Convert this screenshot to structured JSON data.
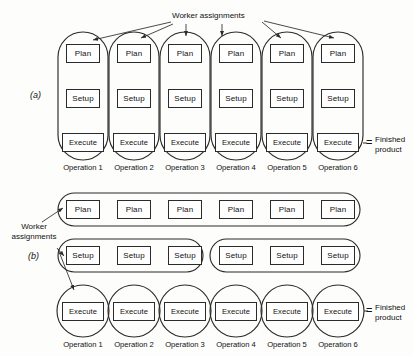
{
  "figure": {
    "background_color": "#fdfdfc",
    "line_color": "#2b2b2b",
    "text_color": "#111111"
  },
  "labels": {
    "worker_assignments_top": "Worker assignments",
    "worker_assignments_left_line1": "Worker",
    "worker_assignments_left_line2": "assignments",
    "part_a": "(a)",
    "part_b": "(b)",
    "finished_line1": "Finished",
    "finished_line2": "product",
    "equals": "="
  },
  "stages": {
    "plan": "Plan",
    "setup": "Setup",
    "execute": "Execute"
  },
  "operations": [
    "Operation 1",
    "Operation 2",
    "Operation 3",
    "Operation 4",
    "Operation 5",
    "Operation 6"
  ],
  "panel_a": {
    "part_letter": "(a)",
    "description": "Each worker performs plan, setup and execute for one operation",
    "grouping": "vertical",
    "worker_count": 6,
    "columns": [
      {
        "operation": "Operation 1",
        "cells": [
          "Plan",
          "Setup",
          "Execute"
        ]
      },
      {
        "operation": "Operation 2",
        "cells": [
          "Plan",
          "Setup",
          "Execute"
        ]
      },
      {
        "operation": "Operation 3",
        "cells": [
          "Plan",
          "Setup",
          "Execute"
        ]
      },
      {
        "operation": "Operation 4",
        "cells": [
          "Plan",
          "Setup",
          "Execute"
        ]
      },
      {
        "operation": "Operation 5",
        "cells": [
          "Plan",
          "Setup",
          "Execute"
        ]
      },
      {
        "operation": "Operation 6",
        "cells": [
          "Plan",
          "Setup",
          "Execute"
        ]
      }
    ],
    "output_label": "Finished product"
  },
  "panel_b": {
    "part_letter": "(b)",
    "description": "Specialized workers: one plans all, two set up, six execute",
    "grouping": "horizontal",
    "rows": [
      {
        "stage": "Plan",
        "groups": [
          {
            "operations": [
              "Operation 1",
              "Operation 2",
              "Operation 3",
              "Operation 4",
              "Operation 5",
              "Operation 6"
            ]
          }
        ]
      },
      {
        "stage": "Setup",
        "groups": [
          {
            "operations": [
              "Operation 1",
              "Operation 2",
              "Operation 3"
            ]
          },
          {
            "operations": [
              "Operation 4",
              "Operation 5",
              "Operation 6"
            ]
          }
        ]
      },
      {
        "stage": "Execute",
        "groups": [
          {
            "operations": [
              "Operation 1"
            ]
          },
          {
            "operations": [
              "Operation 2"
            ]
          },
          {
            "operations": [
              "Operation 3"
            ]
          },
          {
            "operations": [
              "Operation 4"
            ]
          },
          {
            "operations": [
              "Operation 5"
            ]
          },
          {
            "operations": [
              "Operation 6"
            ]
          }
        ]
      }
    ],
    "output_label": "Finished product"
  }
}
